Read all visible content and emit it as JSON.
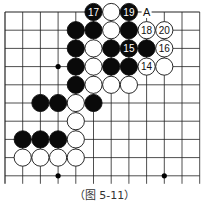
{
  "caption": "（图 5-11）",
  "board": {
    "cols": 12,
    "rows": 10,
    "x0": 5,
    "y0": 12,
    "dx": 17.7,
    "dy": 18.2,
    "open_right": true,
    "open_bottom": true,
    "star_points": [
      [
        3,
        3
      ],
      [
        3,
        9
      ],
      [
        9,
        9
      ]
    ],
    "stones": [
      {
        "col": 5,
        "row": 0,
        "color": "black",
        "label": "17"
      },
      {
        "col": 6,
        "row": 0,
        "color": "white",
        "label": ""
      },
      {
        "col": 7,
        "row": 0,
        "color": "black",
        "label": "19"
      },
      {
        "col": 4,
        "row": 1,
        "color": "black",
        "label": ""
      },
      {
        "col": 5,
        "row": 1,
        "color": "black",
        "label": ""
      },
      {
        "col": 6,
        "row": 1,
        "color": "white",
        "label": ""
      },
      {
        "col": 7,
        "row": 1,
        "color": "black",
        "label": ""
      },
      {
        "col": 8,
        "row": 1,
        "color": "white",
        "label": "18"
      },
      {
        "col": 9,
        "row": 1,
        "color": "white",
        "label": "20"
      },
      {
        "col": 4,
        "row": 2,
        "color": "black",
        "label": ""
      },
      {
        "col": 5,
        "row": 2,
        "color": "white",
        "label": ""
      },
      {
        "col": 6,
        "row": 2,
        "color": "black",
        "label": ""
      },
      {
        "col": 7,
        "row": 2,
        "color": "black",
        "label": "15"
      },
      {
        "col": 8,
        "row": 2,
        "color": "black",
        "label": ""
      },
      {
        "col": 9,
        "row": 2,
        "color": "white",
        "label": "16"
      },
      {
        "col": 4,
        "row": 3,
        "color": "black",
        "label": ""
      },
      {
        "col": 5,
        "row": 3,
        "color": "white",
        "label": ""
      },
      {
        "col": 6,
        "row": 3,
        "color": "black",
        "label": ""
      },
      {
        "col": 7,
        "row": 3,
        "color": "black",
        "label": ""
      },
      {
        "col": 8,
        "row": 3,
        "color": "white",
        "label": "14"
      },
      {
        "col": 9,
        "row": 3,
        "color": "white",
        "label": ""
      },
      {
        "col": 4,
        "row": 4,
        "color": "black",
        "label": ""
      },
      {
        "col": 5,
        "row": 4,
        "color": "white",
        "label": ""
      },
      {
        "col": 6,
        "row": 4,
        "color": "white",
        "label": ""
      },
      {
        "col": 7,
        "row": 4,
        "color": "white",
        "label": ""
      },
      {
        "col": 2,
        "row": 5,
        "color": "black",
        "label": ""
      },
      {
        "col": 3,
        "row": 5,
        "color": "black",
        "label": ""
      },
      {
        "col": 4,
        "row": 5,
        "color": "white",
        "label": ""
      },
      {
        "col": 5,
        "row": 5,
        "color": "black",
        "label": ""
      },
      {
        "col": 4,
        "row": 6,
        "color": "white",
        "label": ""
      },
      {
        "col": 1,
        "row": 7,
        "color": "black",
        "label": ""
      },
      {
        "col": 2,
        "row": 7,
        "color": "black",
        "label": ""
      },
      {
        "col": 3,
        "row": 7,
        "color": "black",
        "label": ""
      },
      {
        "col": 4,
        "row": 7,
        "color": "white",
        "label": ""
      },
      {
        "col": 1,
        "row": 8,
        "color": "white",
        "label": ""
      },
      {
        "col": 2,
        "row": 8,
        "color": "white",
        "label": ""
      },
      {
        "col": 3,
        "row": 8,
        "color": "white",
        "label": ""
      },
      {
        "col": 4,
        "row": 8,
        "color": "white",
        "label": ""
      }
    ],
    "marks": [
      {
        "col": 8,
        "row": 0,
        "label": "A"
      }
    ]
  }
}
